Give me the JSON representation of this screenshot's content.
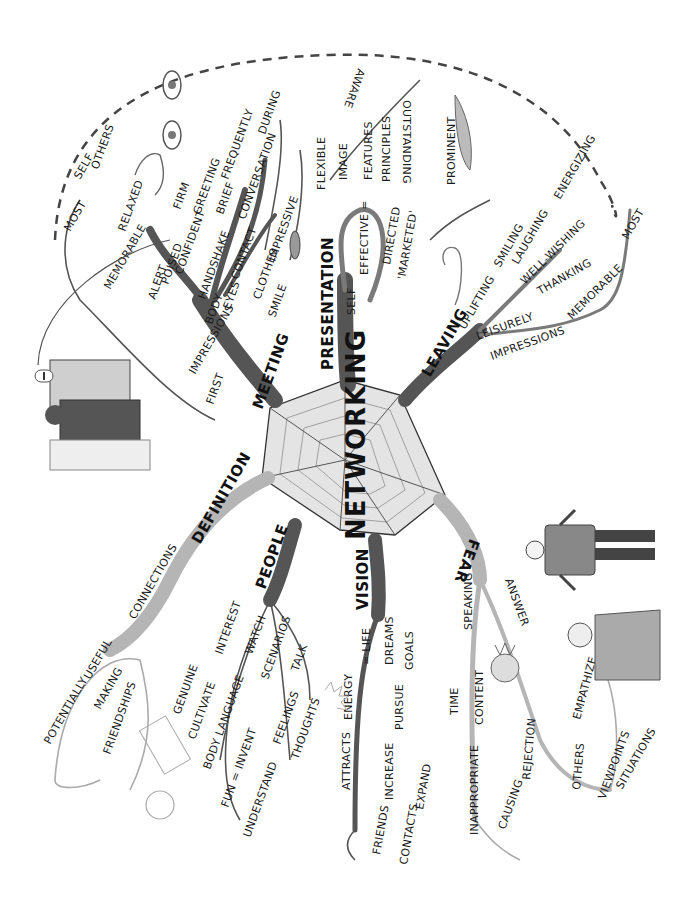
{
  "center": {
    "label": "NETWORKING"
  },
  "colors": {
    "dark_branch": "#555555",
    "mid_branch": "#7a7a7a",
    "light_branch": "#b5b5b5",
    "web_fill": "#d9d9d9",
    "text": "#1a1a1a"
  },
  "branches": {
    "meeting": {
      "label": "MEETING",
      "first": "FIRST",
      "impressions": "IMPRESSIONS",
      "memorable": "MEMORABLE",
      "most": "MOST",
      "self": "SELF",
      "others": "OTHERS",
      "relaxed": "RELAXED",
      "body": "BODY",
      "alert": "ALERT",
      "poised": "POISED",
      "confident": "CONFIDENT",
      "handshake": "HANDSHAKE",
      "firm": "FIRM",
      "eyes": "EYES",
      "contact": "CONTACT",
      "greeting": "GREETING",
      "brief": "BRIEF",
      "frequently": "FREQUENTLY",
      "conversation": "CONVERSATION",
      "during": "DURING",
      "clothes": "CLOTHES",
      "impressive": "IMPRESSIVE",
      "smile": "SMILE"
    },
    "presentation": {
      "label": "PRESENTATION",
      "self": "SELF",
      "effective": "EFFECTIVE =",
      "image": "IMAGE",
      "flexible": "FLEXIBLE",
      "features": "FEATURES",
      "principles": "PRINCIPLES",
      "aware": "AWARE",
      "outstanding": "OUTSTANDING",
      "prominent": "PROMINENT",
      "directed": "DIRECTED",
      "marketed": "'MARKETED'"
    },
    "leaving": {
      "label": "LEAVING",
      "uplifting": "UPLIFTING",
      "smiling": "SMILING",
      "laughing": "LAUGHING",
      "energizing": "ENERGIZING",
      "well_wishing": "WELL-WISHING",
      "thanking": "THANKING",
      "leisurely": "LEISURELY",
      "impressions": "IMPRESSIONS",
      "memorable": "MEMORABLE",
      "most": "MOST"
    },
    "definition": {
      "label": "DEFINITION",
      "connections": "CONNECTIONS",
      "potentially": "POTENTIALLY",
      "useful": "USEFUL",
      "making": "MAKING",
      "friendships": "FRIENDSHIPS"
    },
    "people": {
      "label": "PEOPLE",
      "interest": "INTEREST",
      "genuine": "GENUINE",
      "cultivate": "CULTIVATE",
      "watch": "WATCH",
      "body_language": "BODY LANGUAGE",
      "scenarios": "SCENARIOS",
      "fun_invent": "FUN = INVENT",
      "talk": "TALK",
      "feelings": "FEELINGS",
      "thoughts": "THOUGHTS",
      "understand": "UNDERSTAND"
    },
    "vision": {
      "label": "VISION",
      "life": "= LIFE",
      "energy": "ENERGY",
      "attracts": "ATTRACTS",
      "friends": "FRIENDS",
      "dreams": "DREAMS",
      "goals": "GOALS",
      "pursue": "PURSUE",
      "increase": "INCREASE",
      "contacts": "CONTACTS",
      "expand": "EXPAND"
    },
    "fear": {
      "label": "FEAR",
      "speaking": "SPEAKING",
      "time": "TIME",
      "content": "CONTENT",
      "inappropriate": "INAPPROPRIATE",
      "rejection": "REJECTION",
      "causing": "CAUSING",
      "answer": "ANSWER",
      "empathize": "EMPATHIZE",
      "others": "OTHERS",
      "viewpoints": "VIEWPOINTS",
      "situations": "SITUATIONS"
    }
  }
}
